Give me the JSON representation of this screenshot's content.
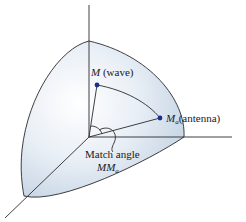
{
  "figure": {
    "colors": {
      "sphere_fill_light": "#f4f7fb",
      "sphere_fill_dark": "#c9d7e6",
      "outline": "#2a2a2a",
      "point": "#1b2f8a"
    },
    "points": [
      {
        "id": "M",
        "symbol": "M",
        "subscript": "",
        "description": "(wave)"
      },
      {
        "id": "Ma",
        "symbol": "M",
        "subscript": "a",
        "description": "(antenna)"
      }
    ],
    "angle_label": {
      "line1": "Match angle",
      "line2_symbol": "MM",
      "line2_subscript": "a"
    }
  }
}
